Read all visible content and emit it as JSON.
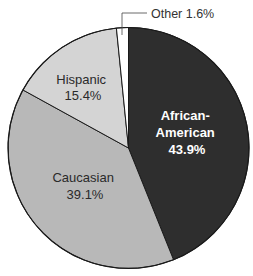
{
  "chart_data": {
    "type": "pie",
    "title": "",
    "start_angle_deg": 0,
    "direction": "clockwise",
    "slices": [
      {
        "label": "African-American",
        "label_lines": [
          "African-",
          "American"
        ],
        "value": 43.9,
        "value_label": "43.9%",
        "color": "#2e2e2e",
        "label_color": "#ffffff"
      },
      {
        "label": "Caucasian",
        "label_lines": [
          "Caucasian"
        ],
        "value": 39.1,
        "value_label": "39.1%",
        "color": "#b8b8b8",
        "label_color": "#2a2a2a"
      },
      {
        "label": "Hispanic",
        "label_lines": [
          "Hispanic"
        ],
        "value": 15.4,
        "value_label": "15.4%",
        "color": "#d4d4d4",
        "label_color": "#2a2a2a"
      },
      {
        "label": "Other",
        "label_lines": [
          "Other"
        ],
        "value": 1.6,
        "value_label": "1.6%",
        "color": "#ffffff",
        "label_color": "#333333",
        "callout": "Other 1.6%"
      }
    ],
    "legend": "none",
    "labels_position": "inside (Other via leader line)"
  }
}
